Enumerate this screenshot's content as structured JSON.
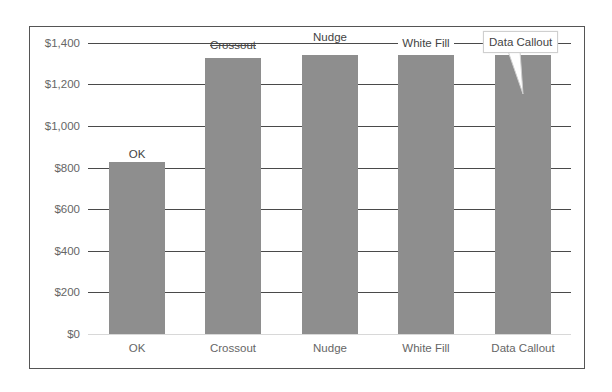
{
  "chart_data": {
    "type": "bar",
    "title": "",
    "xlabel": "",
    "ylabel": "",
    "categories": [
      "OK",
      "Crossout",
      "Nudge",
      "White Fill",
      "Data Callout"
    ],
    "values": [
      825,
      1328,
      1342,
      1342,
      1342
    ],
    "ylim": [
      0,
      1400
    ],
    "yticks": [
      "$0",
      "$200",
      "$400",
      "$600",
      "$800",
      "$1,000",
      "$1,200",
      "$1,400"
    ],
    "grid": true,
    "legend": null,
    "data_labels": [
      {
        "category": "OK",
        "text": "OK",
        "style": "normal"
      },
      {
        "category": "Crossout",
        "text": "Crossout",
        "style": "crossed-by-gridline"
      },
      {
        "category": "Nudge",
        "text": "Nudge",
        "style": "nudged-above-gridline"
      },
      {
        "category": "White Fill",
        "text": "White Fill",
        "style": "white-fill-background"
      },
      {
        "category": "Data Callout",
        "text": "Data Callout",
        "style": "callout-bubble"
      }
    ],
    "colors": {
      "bar": "#8e8e8e",
      "gridline": "#4a4a4a",
      "frame": "#555555",
      "text": "#666666"
    }
  }
}
